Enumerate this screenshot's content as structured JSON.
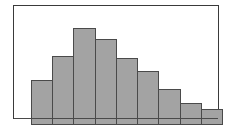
{
  "figure": {
    "title": "",
    "frame_color": "#3a3a3a",
    "background_color": "#ffffff",
    "bar_fill_color": "#a3a3a3",
    "bar_edge_color": "#4a4a4a"
  },
  "chart_data": {
    "type": "bar",
    "title": "",
    "subtitle": "",
    "xlabel": "",
    "ylabel": "",
    "categories": [
      "1",
      "2",
      "3",
      "4",
      "5",
      "6",
      "7",
      "8",
      "9"
    ],
    "values": [
      45,
      69,
      97,
      86,
      67,
      54,
      36,
      22,
      16
    ],
    "ylim": [
      0,
      113
    ],
    "xlim": [
      0,
      9
    ],
    "grid": false,
    "legend": null,
    "tick_labels": {
      "x": [],
      "y": []
    },
    "annotations": [],
    "series": [
      {
        "name": "frequency",
        "values": [
          45,
          69,
          97,
          86,
          67,
          54,
          36,
          22,
          16
        ]
      }
    ]
  }
}
